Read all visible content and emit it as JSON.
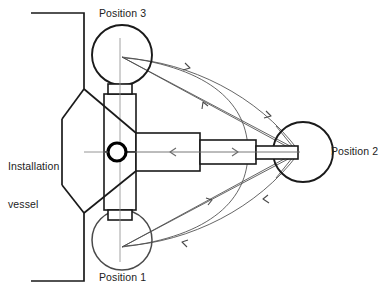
{
  "diagram": {
    "labels": {
      "vessel_line1": "Installation",
      "vessel_line2": "vessel",
      "position1": "Position 1",
      "position2": "Position 2",
      "position3": "Position 3"
    },
    "colors": {
      "stroke_heavy": "#1a1a1a",
      "stroke_light": "#4a4a4a",
      "background": "#ffffff",
      "text": "#222222"
    },
    "geometry": {
      "hub": {
        "cx": 117,
        "cy": 152,
        "r": 9
      },
      "position1_circle": {
        "cx": 122,
        "cy": 240,
        "r": 30
      },
      "position2_circle": {
        "cx": 303,
        "cy": 152,
        "r": 30
      },
      "position3_circle": {
        "cx": 122,
        "cy": 55,
        "r": 30
      },
      "convergence_point": {
        "x": 297,
        "y": 152
      },
      "arm_sections": 3,
      "vessel_outline": "tapered hull with bow notch on the left"
    },
    "icon_names": [
      "pivot-hub-icon",
      "telescopic-arm-icon",
      "trajectory-arrow-icon",
      "vessel-hull-icon"
    ]
  }
}
